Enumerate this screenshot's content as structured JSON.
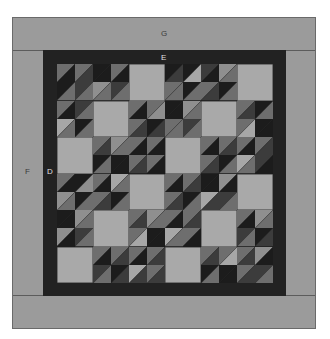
{
  "labels": {
    "G": "G",
    "E": "E",
    "F": "F",
    "D": "D"
  },
  "colors": {
    "outer_border": "#9b9b9b",
    "frame": "#222222",
    "light_square": "#a9a9a9",
    "palette": {
      "K": "#1c1c1c",
      "D": "#3c3c3c",
      "M": "#6e6e6e",
      "L": "#8f8f8f",
      "P": "#a7a7a7"
    }
  },
  "quilt": {
    "rows": 12,
    "cols": 12,
    "light_blocks": [
      [
        0,
        2
      ],
      [
        0,
        5
      ],
      [
        1,
        1
      ],
      [
        1,
        4
      ],
      [
        2,
        0
      ],
      [
        2,
        3
      ],
      [
        3,
        2
      ],
      [
        3,
        5
      ],
      [
        4,
        1
      ],
      [
        4,
        4
      ],
      [
        5,
        0
      ],
      [
        5,
        3
      ]
    ],
    "cells": [
      [
        "MK",
        "MD",
        "KK",
        "MK",
        "--",
        "--",
        "KD",
        "KP",
        "DK",
        "LM",
        "--",
        "--"
      ],
      [
        "KM",
        "DM",
        "LM",
        "DM",
        "--",
        "--",
        "MM",
        "KM",
        "MD",
        "KM",
        "--",
        "--"
      ],
      [
        "MK",
        "DM",
        "--",
        "--",
        "MK",
        "ML",
        "KK",
        "LM",
        "--",
        "--",
        "MD",
        "KM"
      ],
      [
        "PM",
        "KM",
        "--",
        "--",
        "MD",
        "KD",
        "MM",
        "DM",
        "--",
        "--",
        "MP",
        "KK"
      ],
      [
        "--",
        "--",
        "MD",
        "LM",
        "MK",
        "MK",
        "--",
        "--",
        "MK",
        "MD",
        "MK",
        "MD"
      ],
      [
        "--",
        "--",
        "KM",
        "KK",
        "MD",
        "MK",
        "--",
        "--",
        "MD",
        "KM",
        "PM",
        "DK"
      ],
      [
        "MK",
        "KL",
        "MK",
        "PM",
        "--",
        "--",
        "MK",
        "MD",
        "KK",
        "LK",
        "--",
        "--"
      ],
      [
        "LM",
        "KM",
        "MD",
        "KM",
        "--",
        "--",
        "MD",
        "KM",
        "PD",
        "DM",
        "--",
        "--"
      ],
      [
        "KK",
        "LM",
        "--",
        "--",
        "MD",
        "LM",
        "MK",
        "MD",
        "--",
        "--",
        "MK",
        "LM"
      ],
      [
        "LK",
        "DM",
        "--",
        "--",
        "MP",
        "KK",
        "PM",
        "MK",
        "--",
        "--",
        "DM",
        "KD"
      ],
      [
        "--",
        "--",
        "MK",
        "MD",
        "MK",
        "MD",
        "--",
        "--",
        "MD",
        "MP",
        "MD",
        "LK"
      ],
      [
        "--",
        "--",
        "DM",
        "KD",
        "PD",
        "MD",
        "--",
        "--",
        "KM",
        "KK",
        "MD",
        "DM"
      ]
    ]
  }
}
